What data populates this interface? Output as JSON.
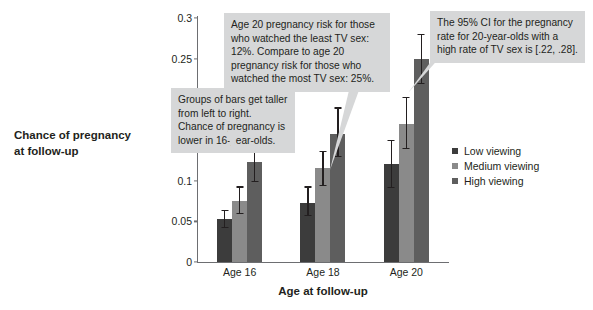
{
  "chart_data": {
    "type": "bar",
    "title": "",
    "subtitle": "",
    "xlabel": "Age at follow-up",
    "ylabel": "Chance of pregnancy at follow-up",
    "categories": [
      "Age 16",
      "Age 18",
      "Age 20"
    ],
    "ylim": [
      0,
      0.3
    ],
    "yticks": [
      "0",
      "0.05",
      "0.1",
      "0.15",
      "0.2",
      "0.25",
      "0.3"
    ],
    "ytick_values": [
      0,
      0.05,
      0.1,
      0.15,
      0.2,
      0.25,
      0.3
    ],
    "grid": false,
    "legend_position": "right",
    "error_bars": "95% confidence interval",
    "series": [
      {
        "name": "Low viewing",
        "color": "#3c3c3c",
        "values": [
          0.053,
          0.073,
          0.12
        ],
        "err_low": [
          0.043,
          0.058,
          0.092
        ],
        "err_high": [
          0.064,
          0.093,
          0.15
        ]
      },
      {
        "name": "Medium viewing",
        "color": "#8a8a8a",
        "values": [
          0.075,
          0.115,
          0.17
        ],
        "err_low": [
          0.06,
          0.095,
          0.14
        ],
        "err_high": [
          0.093,
          0.137,
          0.203
        ]
      },
      {
        "name": "High viewing",
        "color": "#5e5e5e",
        "values": [
          0.123,
          0.157,
          0.25
        ],
        "err_low": [
          0.1,
          0.13,
          0.22
        ],
        "err_high": [
          0.148,
          0.19,
          0.28
        ]
      }
    ],
    "annotations": [
      {
        "id": "left",
        "text": "Groups of bars get taller from left to right. Chance of pregnancy is lower in 16-year-olds."
      },
      {
        "id": "mid",
        "text": "Age 20 pregnancy risk for those who watched the least TV sex: 12%. Compare to age 20 pregnancy risk for those who watched the most TV sex: 25%."
      },
      {
        "id": "right",
        "text": "The 95% CI for the pregnancy rate for 20-year-olds with a high rate of TV sex is [.22, .28]."
      }
    ]
  },
  "legend": {
    "items": [
      {
        "label": "Low viewing",
        "color": "#3c3c3c"
      },
      {
        "label": "Medium viewing",
        "color": "#8a8a8a"
      },
      {
        "label": "High viewing",
        "color": "#5e5e5e"
      }
    ]
  },
  "axes": {
    "y_title": "Chance of pregnancy at follow-up",
    "y_title_line1": "Chance of pregnancy",
    "y_title_line2": "at follow-up",
    "x_title": "Age at follow-up",
    "yticks": [
      "0.3",
      "0.25",
      "0.2",
      "0.15",
      "0.1",
      "0.05",
      "0"
    ],
    "xticks": [
      "Age 16",
      "Age 18",
      "Age 20"
    ]
  },
  "callouts": {
    "left": "Groups of bars get taller from left to right. Chance of pregnancy is lower in 16-year-olds.",
    "mid": "Age 20 pregnancy risk for those who watched the least TV sex: 12%. Compare to age 20 pregnancy risk for those who watched the most TV sex: 25%.",
    "right": "The 95% CI for the pregnancy rate for 20-year-olds with a high rate of TV sex is [.22, .28]."
  }
}
